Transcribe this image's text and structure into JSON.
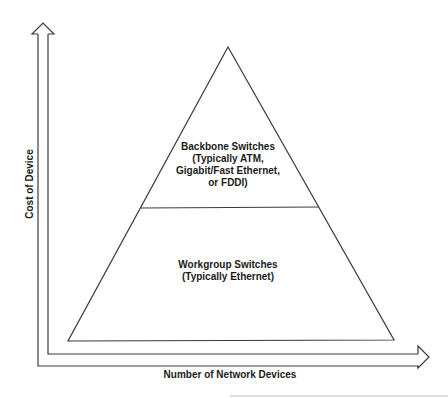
{
  "diagram": {
    "type": "pyramid",
    "tiers": [
      {
        "id": "backbone",
        "position": "top",
        "lines": [
          "Backbone Switches",
          "(Typically ATM,",
          "Gigabit/Fast Ethernet,",
          "or FDDI)"
        ]
      },
      {
        "id": "workgroup",
        "position": "bottom",
        "lines": [
          "Workgroup Switches",
          "(Typically Ethernet)"
        ]
      }
    ],
    "axes": {
      "x_label": "Number of Network Devices",
      "y_label": "Cost of Device"
    },
    "colors": {
      "stroke": "#3a3a3a",
      "text": "#1a1a1a",
      "background": "#ffffff",
      "artifact_line": "#bdbdbd"
    }
  }
}
